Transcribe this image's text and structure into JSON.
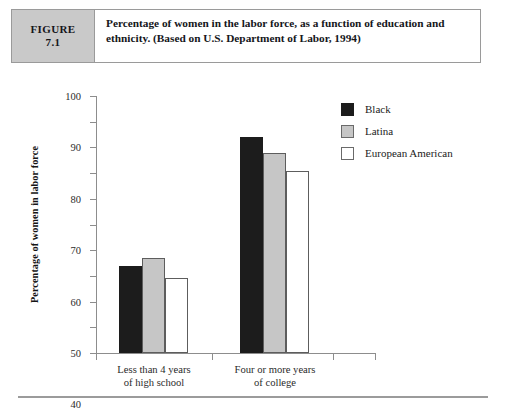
{
  "figure": {
    "tag_word": "FIGURE",
    "tag_number": "7.1",
    "caption": "Percentage of women in the labor force, as a function of education and ethnicity. (Based on U.S. Department of Labor, 1994)"
  },
  "legend": {
    "items": [
      {
        "label": "Black",
        "swatch": "black",
        "color": "#1c1c1c"
      },
      {
        "label": "Latina",
        "swatch": "gray",
        "color": "#c6c6c6"
      },
      {
        "label": "European American",
        "swatch": "white",
        "color": "#ffffff"
      }
    ]
  },
  "axis": {
    "y_title": "Percentage of women in labor force",
    "y_ticks": [
      "100",
      "90",
      "80",
      "70",
      "60",
      "50",
      "40",
      "30",
      "20",
      "10",
      "0"
    ],
    "x_categories": [
      {
        "line1": "Less than 4 years",
        "line2": "of high school"
      },
      {
        "line1": "Four or more years",
        "line2": "of college"
      }
    ]
  },
  "chart_data": {
    "type": "bar",
    "title": "Percentage of women in the labor force, as a function of education and ethnicity. (Based on U.S. Department of Labor, 1994)",
    "xlabel": "",
    "ylabel": "Percentage of women in labor force",
    "ylim": [
      0,
      100
    ],
    "ytick_interval": 10,
    "grid": false,
    "legend_position": "top-right",
    "categories": [
      "Less than 4 years of high school",
      "Four or more years of college"
    ],
    "series": [
      {
        "name": "Black",
        "color": "#1c1c1c",
        "values": [
          34,
          84
        ]
      },
      {
        "name": "Latina",
        "color": "#c6c6c6",
        "values": [
          37,
          78
        ]
      },
      {
        "name": "European American",
        "color": "#ffffff",
        "values": [
          29,
          71
        ]
      }
    ]
  }
}
